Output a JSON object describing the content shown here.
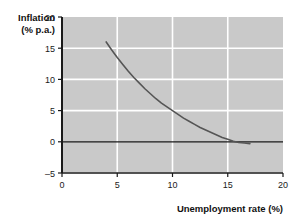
{
  "chart_data": {
    "type": "line",
    "title": "",
    "xlabel": "Unemployment rate (%)",
    "ylabel_line1": "Inflation",
    "ylabel_line2": "(% p.a.)",
    "xlim": [
      0,
      20
    ],
    "ylim": [
      -5,
      20
    ],
    "xticks": [
      0,
      5,
      10,
      15,
      20
    ],
    "yticks": [
      -5,
      0,
      5,
      10,
      15,
      20
    ],
    "xtick_labels": [
      "0",
      "5",
      "10",
      "15",
      "20"
    ],
    "ytick_labels": [
      "–5",
      "0",
      "5",
      "10",
      "15",
      "20"
    ],
    "grid": true,
    "grid_color": "#ffffff",
    "plot_background": "#c9c9c9",
    "zero_line_value": 0,
    "zero_line_color": "#1a1a1a",
    "legend": "none",
    "series": [
      {
        "name": "Phillips curve",
        "color": "#555555",
        "x": [
          4.0,
          4.5,
          5.0,
          5.5,
          6.0,
          6.5,
          7.0,
          7.5,
          8.0,
          8.5,
          9.0,
          9.5,
          10.0,
          10.5,
          11.0,
          11.5,
          12.0,
          12.5,
          13.0,
          13.5,
          14.0,
          14.5,
          15.0,
          15.5,
          16.0,
          16.5,
          17.0
        ],
        "y": [
          16.0,
          14.7,
          13.5,
          12.4,
          11.3,
          10.3,
          9.4,
          8.5,
          7.7,
          6.9,
          6.2,
          5.6,
          5.0,
          4.4,
          3.8,
          3.3,
          2.8,
          2.3,
          1.9,
          1.5,
          1.1,
          0.7,
          0.4,
          0.1,
          -0.1,
          -0.2,
          -0.3
        ]
      }
    ]
  },
  "axes": {
    "x_axis_name": "unemployment-rate-axis",
    "y_axis_name": "inflation-axis"
  }
}
